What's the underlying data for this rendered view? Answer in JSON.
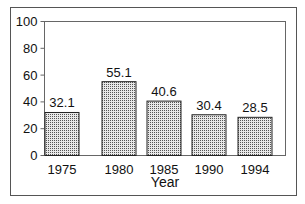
{
  "chart_data": {
    "type": "bar",
    "title": "",
    "xlabel": "Year",
    "ylabel": "",
    "categories": [
      "1975",
      "1980",
      "1985",
      "1990",
      "1994"
    ],
    "values": [
      32.1,
      55.1,
      40.6,
      30.4,
      28.5
    ],
    "value_labels": [
      "32.1",
      "55.1",
      "40.6",
      "30.4",
      "28.5"
    ],
    "ylim": [
      0,
      100
    ],
    "yticks": [
      0,
      20,
      40,
      60,
      80,
      100
    ],
    "grid": false,
    "legend": null,
    "bar_fill": "dotted-gray-pattern",
    "colors": {
      "bar_edge": "#222222",
      "bar_dots": "#555555",
      "frame": "#555555"
    }
  }
}
